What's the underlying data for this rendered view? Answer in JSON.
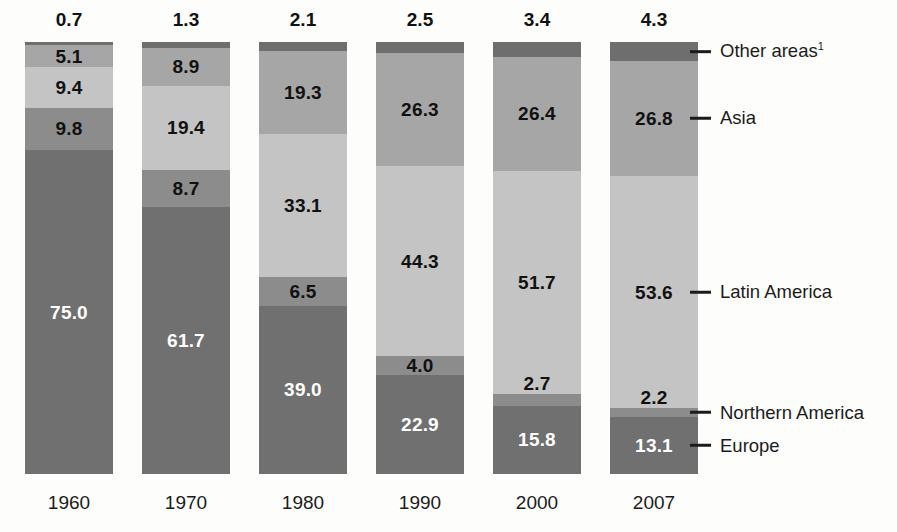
{
  "chart_data": {
    "type": "bar",
    "subtype": "stacked-100-percent",
    "title": "",
    "xlabel": "",
    "ylabel": "",
    "ylim": [
      0,
      100
    ],
    "grid": false,
    "legend_position": "right",
    "categories": [
      "1960",
      "1970",
      "1980",
      "1990",
      "2000",
      "2007"
    ],
    "series": [
      {
        "name": "Other areas",
        "color": "#6e6e6e",
        "label_color": "#111111",
        "label_outside_top": true,
        "values": [
          0.7,
          1.3,
          2.1,
          2.5,
          3.4,
          4.3
        ]
      },
      {
        "name": "Asia",
        "color": "#a6a6a6",
        "label_color": "#111111",
        "values": [
          5.1,
          8.9,
          19.3,
          26.3,
          26.4,
          26.8
        ]
      },
      {
        "name": "Latin America",
        "color": "#c4c4c4",
        "label_color": "#111111",
        "values": [
          9.4,
          19.4,
          33.1,
          44.3,
          51.7,
          53.6
        ]
      },
      {
        "name": "Northern America",
        "color": "#8c8c8c",
        "label_color": "#111111",
        "values": [
          9.8,
          8.7,
          6.5,
          4.0,
          2.7,
          2.2
        ]
      },
      {
        "name": "Europe",
        "color": "#707070",
        "label_color": "#ffffff",
        "values": [
          75.0,
          61.7,
          39.0,
          22.9,
          15.8,
          13.1
        ]
      }
    ],
    "value_labels": {
      "1960": [
        "0.7",
        "5.1",
        "9.4",
        "9.8",
        "75.0"
      ],
      "1970": [
        "1.3",
        "8.9",
        "19.4",
        "8.7",
        "61.7"
      ],
      "1980": [
        "2.1",
        "19.3",
        "33.1",
        "6.5",
        "39.0"
      ],
      "1990": [
        "2.5",
        "26.3",
        "44.3",
        "4.0",
        "22.9"
      ],
      "2000": [
        "3.4",
        "26.4",
        "51.7",
        "2.7",
        "15.8"
      ],
      "2007": [
        "4.3",
        "26.8",
        "53.6",
        "2.2",
        "13.1"
      ]
    }
  },
  "legend": {
    "items": [
      {
        "label": "Other areas",
        "footnote": "1"
      },
      {
        "label": "Asia",
        "footnote": ""
      },
      {
        "label": "Latin America",
        "footnote": ""
      },
      {
        "label": "Northern America",
        "footnote": ""
      },
      {
        "label": "Europe",
        "footnote": ""
      }
    ]
  }
}
